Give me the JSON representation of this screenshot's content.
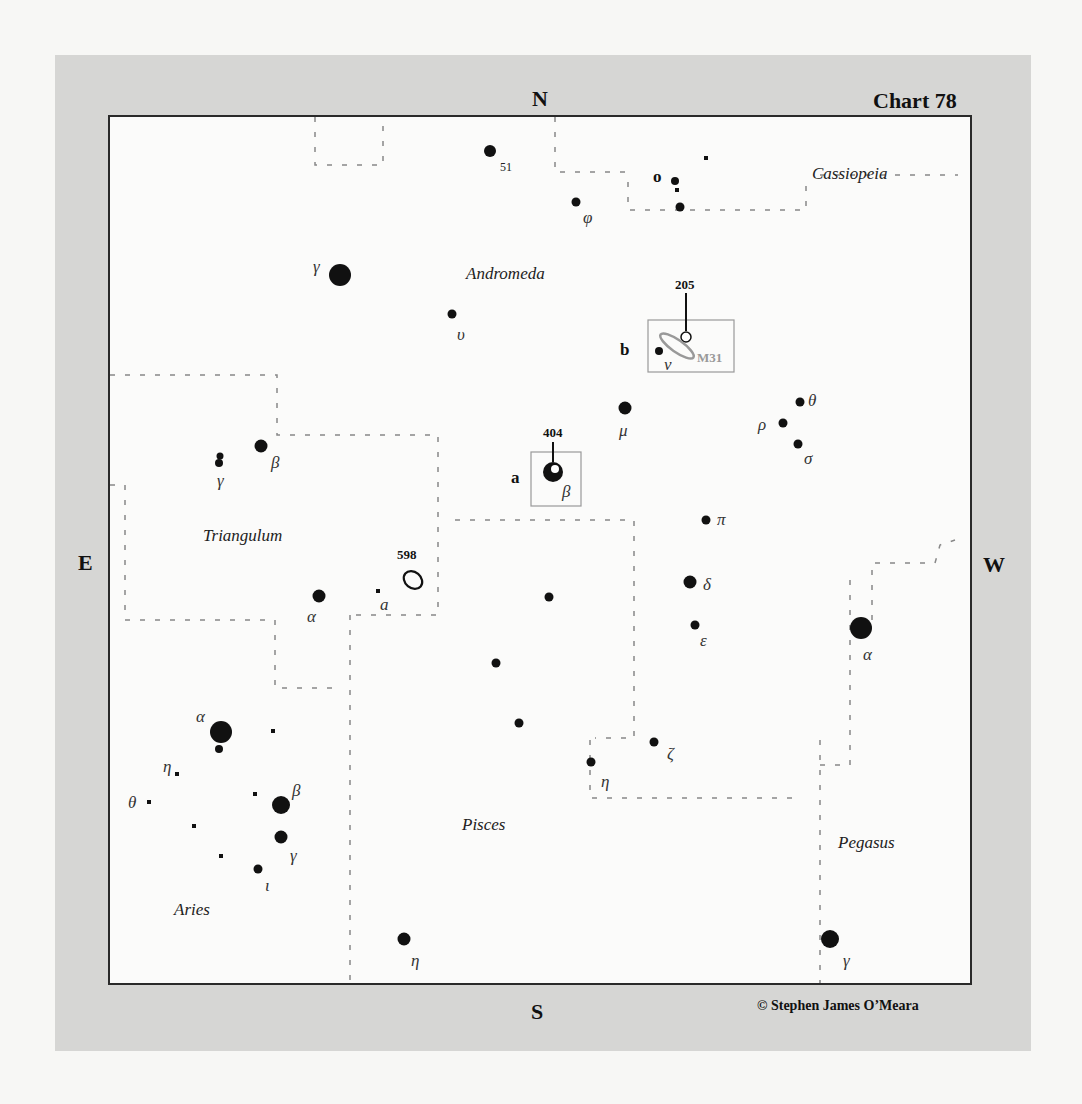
{
  "chart": {
    "title": "Chart 78",
    "credit": "© Stephen James O’Meara",
    "directions": {
      "north": "N",
      "south": "S",
      "east": "E",
      "west": "W"
    },
    "colors": {
      "frame": "#d6d6d4",
      "chart_bg": "#fbfbfa",
      "star": "#111111",
      "boundary": "#888888",
      "inset_box": "#999999",
      "galaxy_outline": "#999999"
    }
  },
  "constellations": [
    {
      "name": "Cassiopeia",
      "x": 812,
      "y": 164
    },
    {
      "name": "Andromeda",
      "x": 466,
      "y": 264
    },
    {
      "name": "Triangulum",
      "x": 203,
      "y": 526
    },
    {
      "name": "Pisces",
      "x": 462,
      "y": 815
    },
    {
      "name": "Aries",
      "x": 174,
      "y": 900
    },
    {
      "name": "Pegasus",
      "x": 838,
      "y": 833
    }
  ],
  "stars": [
    {
      "id": "and-51",
      "label": "51",
      "label_type": "num",
      "x": 490,
      "y": 151,
      "r": 6,
      "lx": 500,
      "ly": 160
    },
    {
      "id": "cas-o",
      "label": "o",
      "label_type": "roman",
      "x": 675,
      "y": 181,
      "r": 4,
      "lx": 653,
      "ly": 167
    },
    {
      "id": "cas-o2",
      "label": "",
      "x": 677,
      "y": 190,
      "r": 2,
      "square": true
    },
    {
      "id": "cas-o3",
      "label": "",
      "x": 680,
      "y": 207,
      "r": 4.5
    },
    {
      "id": "cas-sq",
      "label": "",
      "x": 706,
      "y": 158,
      "r": 2,
      "square": true
    },
    {
      "id": "and-phi",
      "label": "φ",
      "label_type": "greek",
      "x": 576,
      "y": 202,
      "r": 4.5,
      "lx": 583,
      "ly": 208
    },
    {
      "id": "and-gamma",
      "label": "γ",
      "label_type": "greek",
      "x": 340,
      "y": 275,
      "r": 11,
      "lx": 313,
      "ly": 257
    },
    {
      "id": "and-upsilon",
      "label": "υ",
      "label_type": "greek",
      "x": 452,
      "y": 314,
      "r": 4.5,
      "lx": 457,
      "ly": 325
    },
    {
      "id": "and-nu",
      "label": "ν",
      "label_type": "greek",
      "x": 659,
      "y": 351,
      "r": 4,
      "lx": 664,
      "ly": 355
    },
    {
      "id": "and-mu",
      "label": "μ",
      "label_type": "greek",
      "x": 625,
      "y": 408,
      "r": 6.5,
      "lx": 619,
      "ly": 421
    },
    {
      "id": "and-theta",
      "label": "θ",
      "label_type": "greek",
      "x": 800,
      "y": 402,
      "r": 4.5,
      "lx": 808,
      "ly": 391
    },
    {
      "id": "and-rho",
      "label": "ρ",
      "label_type": "greek",
      "x": 783,
      "y": 423,
      "r": 4.5,
      "lx": 758,
      "ly": 415
    },
    {
      "id": "and-sigma",
      "label": "σ",
      "label_type": "greek",
      "x": 798,
      "y": 444,
      "r": 4.5,
      "lx": 804,
      "ly": 449
    },
    {
      "id": "and-beta",
      "label": "β",
      "label_type": "greek",
      "x": 553,
      "y": 472,
      "r": 10,
      "lx": 562,
      "ly": 482,
      "highlight": true
    },
    {
      "id": "and-pi",
      "label": "π",
      "label_type": "greek",
      "x": 706,
      "y": 520,
      "r": 4.5,
      "lx": 717,
      "ly": 510
    },
    {
      "id": "and-delta",
      "label": "δ",
      "label_type": "greek",
      "x": 690,
      "y": 582,
      "r": 6.5,
      "lx": 703,
      "ly": 575
    },
    {
      "id": "and-epsilon",
      "label": "ε",
      "label_type": "greek",
      "x": 695,
      "y": 625,
      "r": 4.5,
      "lx": 700,
      "ly": 631
    },
    {
      "id": "and-zeta",
      "label": "ζ",
      "label_type": "greek",
      "x": 654,
      "y": 742,
      "r": 4.5,
      "lx": 667,
      "ly": 744
    },
    {
      "id": "psc-eta2",
      "label": "η",
      "label_type": "greek",
      "x": 591,
      "y": 762,
      "r": 4.5,
      "lx": 601,
      "ly": 772
    },
    {
      "id": "pis-s1",
      "label": "",
      "x": 549,
      "y": 597,
      "r": 4.5
    },
    {
      "id": "pis-s2",
      "label": "",
      "x": 496,
      "y": 663,
      "r": 4.5
    },
    {
      "id": "pis-s3",
      "label": "",
      "x": 519,
      "y": 723,
      "r": 4.5
    },
    {
      "id": "psc-eta",
      "label": "η",
      "label_type": "greek",
      "x": 404,
      "y": 939,
      "r": 6.5,
      "lx": 411,
      "ly": 951
    },
    {
      "id": "tri-beta",
      "label": "β",
      "label_type": "greek",
      "x": 261,
      "y": 446,
      "r": 6.5,
      "lx": 271,
      "ly": 453
    },
    {
      "id": "tri-gamma",
      "label": "γ",
      "label_type": "greek",
      "x": 219,
      "y": 460,
      "r": 4,
      "lx": 217,
      "ly": 471,
      "double": true
    },
    {
      "id": "tri-alpha",
      "label": "α",
      "label_type": "greek",
      "x": 319,
      "y": 596,
      "r": 6.5,
      "lx": 307,
      "ly": 607
    },
    {
      "id": "tri-a",
      "label": "a",
      "label_type": "greek",
      "x": 378,
      "y": 591,
      "r": 2,
      "square": true,
      "lx": 380,
      "ly": 595
    },
    {
      "id": "peg-alpha",
      "label": "α",
      "label_type": "greek",
      "x": 861,
      "y": 628,
      "r": 11,
      "lx": 863,
      "ly": 645
    },
    {
      "id": "peg-gamma",
      "label": "γ",
      "label_type": "greek",
      "x": 830,
      "y": 939,
      "r": 9,
      "lx": 843,
      "ly": 951
    },
    {
      "id": "ari-alpha",
      "label": "α",
      "label_type": "greek",
      "x": 221,
      "y": 732,
      "r": 11,
      "lx": 196,
      "ly": 707
    },
    {
      "id": "ari-alpha2",
      "label": "",
      "x": 219,
      "y": 749,
      "r": 4
    },
    {
      "id": "ari-sq1",
      "label": "",
      "x": 273,
      "y": 731,
      "r": 2,
      "square": true
    },
    {
      "id": "ari-eta",
      "label": "η",
      "label_type": "greek",
      "x": 177,
      "y": 774,
      "r": 2,
      "square": true,
      "lx": 163,
      "ly": 757
    },
    {
      "id": "ari-theta",
      "label": "θ",
      "label_type": "greek",
      "x": 149,
      "y": 802,
      "r": 2,
      "square": true,
      "lx": 128,
      "ly": 793
    },
    {
      "id": "ari-sq2",
      "label": "",
      "x": 255,
      "y": 794,
      "r": 2,
      "square": true
    },
    {
      "id": "ari-beta",
      "label": "β",
      "label_type": "greek",
      "x": 281,
      "y": 805,
      "r": 9,
      "lx": 292,
      "ly": 781
    },
    {
      "id": "ari-sq3",
      "label": "",
      "x": 194,
      "y": 826,
      "r": 2,
      "square": true
    },
    {
      "id": "ari-gamma",
      "label": "γ",
      "label_type": "greek",
      "x": 281,
      "y": 837,
      "r": 6.5,
      "lx": 290,
      "ly": 846
    },
    {
      "id": "ari-sq4",
      "label": "",
      "x": 221,
      "y": 856,
      "r": 2,
      "square": true
    },
    {
      "id": "ari-iota",
      "label": "ι",
      "label_type": "greek",
      "x": 258,
      "y": 869,
      "r": 4.5,
      "lx": 265,
      "ly": 876
    }
  ],
  "deep_sky": [
    {
      "id": "ngc-598",
      "label": "598",
      "type": "galaxy",
      "x": 413,
      "y": 580,
      "rx": 10,
      "ry": 8,
      "rot": 40,
      "lx": 397,
      "ly": 547
    },
    {
      "id": "m31",
      "label": "M31",
      "type": "galaxy",
      "x": 677,
      "y": 346,
      "rx": 20,
      "ry": 6,
      "rot": 35,
      "lx": 697,
      "ly": 350
    }
  ],
  "insets": [
    {
      "id": "inset-a",
      "letter": "a",
      "object_number": "404",
      "box": {
        "x": 531,
        "y": 452,
        "w": 50,
        "h": 54
      },
      "letter_pos": {
        "x": 511,
        "y": 468
      },
      "num_pos": {
        "x": 543,
        "y": 425
      },
      "tick": {
        "x": 553,
        "y1": 442,
        "y2": 462
      }
    },
    {
      "id": "inset-b",
      "letter": "b",
      "object_number": "205",
      "box": {
        "x": 648,
        "y": 320,
        "w": 86,
        "h": 52
      },
      "letter_pos": {
        "x": 620,
        "y": 340
      },
      "num_pos": {
        "x": 675,
        "y": 277
      },
      "tick": {
        "x": 686,
        "y1": 293,
        "y2": 331
      },
      "marker": {
        "x": 686,
        "y": 337,
        "r": 5
      }
    }
  ],
  "boundaries": [
    [
      [
        315,
        117
      ],
      [
        315,
        165
      ],
      [
        383,
        165
      ],
      [
        383,
        117
      ]
    ],
    [
      [
        555,
        117
      ],
      [
        555,
        172
      ],
      [
        628,
        172
      ]
    ],
    [
      [
        628,
        182
      ],
      [
        628,
        210
      ],
      [
        806,
        210
      ],
      [
        806,
        180
      ]
    ],
    [
      [
        820,
        175
      ],
      [
        958,
        175
      ]
    ],
    [
      [
        110,
        375
      ],
      [
        277,
        375
      ],
      [
        277,
        435
      ],
      [
        438,
        435
      ],
      [
        438,
        615
      ],
      [
        355,
        615
      ]
    ],
    [
      [
        110,
        485
      ],
      [
        125,
        485
      ],
      [
        125,
        620
      ],
      [
        275,
        620
      ],
      [
        275,
        688
      ],
      [
        340,
        688
      ]
    ],
    [
      [
        350,
        615
      ],
      [
        350,
        983
      ]
    ],
    [
      [
        455,
        520
      ],
      [
        634,
        520
      ],
      [
        634,
        738
      ],
      [
        595,
        738
      ]
    ],
    [
      [
        590,
        740
      ],
      [
        590,
        798
      ],
      [
        795,
        798
      ]
    ],
    [
      [
        820,
        740
      ],
      [
        820,
        983
      ]
    ],
    [
      [
        820,
        765
      ],
      [
        850,
        765
      ],
      [
        850,
        570
      ]
    ],
    [
      [
        872,
        620
      ],
      [
        872,
        563
      ],
      [
        935,
        563
      ],
      [
        940,
        545
      ],
      [
        955,
        540
      ]
    ]
  ]
}
